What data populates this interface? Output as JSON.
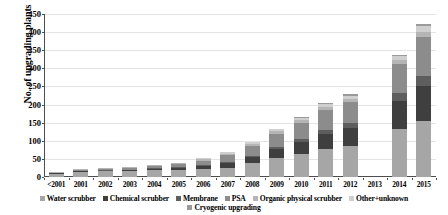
{
  "chart_data": {
    "type": "bar",
    "stacked": true,
    "title": "",
    "xlabel": "",
    "ylabel": "No. of upgrading plants",
    "ylim": [
      0,
      450
    ],
    "ytick_step": 50,
    "yticks": [
      "0",
      "50",
      "100",
      "150",
      "200",
      "250",
      "300",
      "350",
      "400",
      "450"
    ],
    "grid": true,
    "legend_position": "bottom",
    "categories": [
      "<2001",
      "2001",
      "2002",
      "2003",
      "2004",
      "2005",
      "2006",
      "2007",
      "2008",
      "2009",
      "2010",
      "2011",
      "2012",
      "2013",
      "2014",
      "2015"
    ],
    "series": [
      {
        "name": "Water scrubber",
        "color": "#a6a6a6",
        "values": [
          9,
          14,
          16,
          17,
          18,
          20,
          22,
          26,
          38,
          52,
          64,
          76,
          86,
          0,
          133,
          156
        ]
      },
      {
        "name": "Chemical scrubber",
        "color": "#3f3f3f",
        "values": [
          1,
          2,
          2,
          2,
          4,
          5,
          8,
          12,
          16,
          24,
          32,
          42,
          48,
          0,
          78,
          95
        ]
      },
      {
        "name": "Membrane",
        "color": "#5e5e5e",
        "values": [
          0,
          1,
          1,
          1,
          2,
          2,
          3,
          4,
          5,
          7,
          9,
          12,
          14,
          0,
          22,
          28
        ]
      },
      {
        "name": "PSA",
        "color": "#8c8c8c",
        "values": [
          2,
          3,
          4,
          5,
          6,
          8,
          12,
          18,
          26,
          36,
          44,
          54,
          58,
          0,
          78,
          108
        ]
      },
      {
        "name": "Organic physical scrubber",
        "color": "#b5b5b5",
        "values": [
          1,
          1,
          1,
          2,
          2,
          3,
          4,
          5,
          6,
          7,
          8,
          9,
          10,
          0,
          12,
          14
        ]
      },
      {
        "name": "Other+unknown",
        "color": "#cfcfcf",
        "values": [
          0,
          0,
          1,
          1,
          1,
          2,
          3,
          4,
          5,
          6,
          7,
          8,
          9,
          0,
          10,
          16
        ]
      },
      {
        "name": "Cryogenic upgrading",
        "color": "#9a9a9a",
        "values": [
          0,
          0,
          0,
          0,
          0,
          0,
          0,
          1,
          1,
          2,
          2,
          3,
          3,
          0,
          4,
          5
        ]
      }
    ],
    "totals": [
      13,
      21,
      25,
      28,
      33,
      40,
      52,
      70,
      97,
      134,
      166,
      204,
      228,
      0,
      337,
      422
    ]
  },
  "colors": {
    "axis": "#4d4d4d",
    "gridline": "#e4e4e4",
    "text": "#000000",
    "background": "#ffffff"
  }
}
